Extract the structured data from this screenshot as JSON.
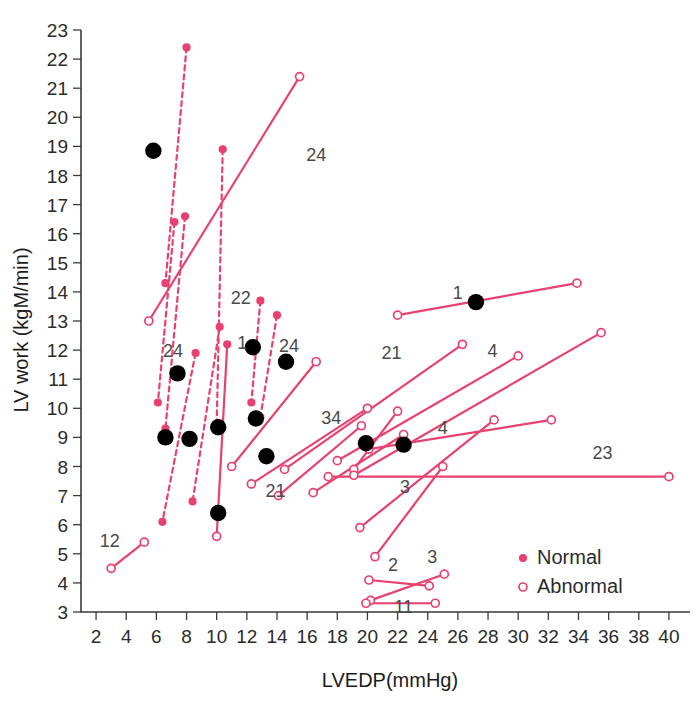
{
  "chart_data": {
    "type": "scatter",
    "title": "",
    "xlabel": "LVEDP(mmHg)",
    "ylabel": "LV work (kgM/min)",
    "xlim": [
      1.0,
      41.0
    ],
    "ylim": [
      2.5,
      23.5
    ],
    "xticks": [
      2,
      4,
      6,
      8,
      10,
      12,
      14,
      16,
      18,
      20,
      22,
      24,
      26,
      28,
      30,
      32,
      34,
      36,
      38,
      40
    ],
    "yticks": [
      3,
      4,
      5,
      6,
      7,
      8,
      9,
      10,
      11,
      12,
      13,
      14,
      15,
      16,
      17,
      18,
      19,
      20,
      21,
      22,
      23
    ],
    "grid": false,
    "legend": {
      "position": "bottom-right",
      "entries": [
        {
          "label": "Normal",
          "marker": "filled-circle",
          "color": "#e8416f"
        },
        {
          "label": "Abnormal",
          "marker": "open-circle",
          "color": "#e8416f"
        }
      ]
    },
    "colors": {
      "line": "#e8416f",
      "normal_marker": "#e8416f",
      "abnormal_marker_edge": "#e8416f",
      "solid_black_point": "#000000",
      "axis": "#3a3a3a",
      "annotation": "#4a4a4a"
    },
    "series": [
      {
        "name": "paired-segments",
        "description": "Each segment connects a paired pre/post measurement; dashed segments are one group, solid segments the other. Endpoint markers: 'normal' = filled pink dot, 'abnormal' = open pink circle.",
        "segments": [
          {
            "id": "s1",
            "style": "dashed",
            "label": "",
            "p1": {
              "x": 8.0,
              "y": 22.4,
              "marker": "normal"
            },
            "p2": {
              "x": 6.6,
              "y": 14.3,
              "marker": "normal"
            }
          },
          {
            "id": "s2",
            "style": "dashed",
            "label": "",
            "p1": {
              "x": 7.2,
              "y": 16.4,
              "marker": "normal"
            },
            "p2": {
              "x": 6.1,
              "y": 10.2,
              "marker": "normal"
            }
          },
          {
            "id": "s3",
            "style": "dashed",
            "label": "",
            "p1": {
              "x": 7.9,
              "y": 16.6,
              "marker": "normal"
            },
            "p2": {
              "x": 6.6,
              "y": 9.3,
              "marker": "normal"
            }
          },
          {
            "id": "s4",
            "style": "dashed",
            "label": "22",
            "p1": {
              "x": 10.4,
              "y": 18.9,
              "marker": "normal"
            },
            "p2": {
              "x": 10.0,
              "y": 9.4,
              "marker": "normal"
            }
          },
          {
            "id": "s5",
            "style": "solid",
            "label": "24",
            "p1": {
              "x": 15.5,
              "y": 21.4,
              "marker": "abnormal"
            },
            "p2": {
              "x": 5.5,
              "y": 13.0,
              "marker": "abnormal"
            }
          },
          {
            "id": "s6",
            "style": "dashed",
            "label": "24",
            "p1": {
              "x": 8.6,
              "y": 11.9,
              "marker": "normal"
            },
            "p2": {
              "x": 6.4,
              "y": 6.1,
              "marker": "normal"
            }
          },
          {
            "id": "s7",
            "style": "dashed",
            "label": "",
            "p1": {
              "x": 10.2,
              "y": 12.8,
              "marker": "normal"
            },
            "p2": {
              "x": 8.4,
              "y": 6.8,
              "marker": "normal"
            }
          },
          {
            "id": "s8",
            "style": "dashed",
            "label": "1",
            "p1": {
              "x": 12.9,
              "y": 13.7,
              "marker": "normal"
            },
            "p2": {
              "x": 12.3,
              "y": 10.2,
              "marker": "normal"
            }
          },
          {
            "id": "s9",
            "style": "dashed",
            "label": "24",
            "p1": {
              "x": 14.0,
              "y": 13.2,
              "marker": "normal"
            },
            "p2": {
              "x": 12.9,
              "y": 9.7,
              "marker": "normal"
            }
          },
          {
            "id": "s10",
            "style": "solid",
            "label": "",
            "p1": {
              "x": 10.0,
              "y": 5.6,
              "marker": "abnormal"
            },
            "p2": {
              "x": 10.7,
              "y": 12.2,
              "marker": "normal"
            }
          },
          {
            "id": "s11",
            "style": "solid",
            "label": "12",
            "p1": {
              "x": 3.0,
              "y": 4.5,
              "marker": "abnormal"
            },
            "p2": {
              "x": 5.2,
              "y": 5.4,
              "marker": "abnormal"
            }
          },
          {
            "id": "s12",
            "style": "solid",
            "label": "",
            "p1": {
              "x": 11.0,
              "y": 8.0,
              "marker": "abnormal"
            },
            "p2": {
              "x": 16.6,
              "y": 11.6,
              "marker": "abnormal"
            }
          },
          {
            "id": "s13",
            "style": "solid",
            "label": "21",
            "p1": {
              "x": 12.3,
              "y": 7.4,
              "marker": "abnormal"
            },
            "p2": {
              "x": 20.0,
              "y": 10.0,
              "marker": "abnormal"
            }
          },
          {
            "id": "s14",
            "style": "solid",
            "label": "",
            "p1": {
              "x": 14.1,
              "y": 7.0,
              "marker": "abnormal"
            },
            "p2": {
              "x": 19.6,
              "y": 9.4,
              "marker": "abnormal"
            }
          },
          {
            "id": "s15",
            "style": "solid",
            "label": "",
            "p1": {
              "x": 16.4,
              "y": 7.1,
              "marker": "abnormal"
            },
            "p2": {
              "x": 22.4,
              "y": 9.1,
              "marker": "abnormal"
            }
          },
          {
            "id": "s16",
            "style": "solid",
            "label": "34",
            "p1": {
              "x": 19.1,
              "y": 7.9,
              "marker": "abnormal"
            },
            "p2": {
              "x": 22.0,
              "y": 9.9,
              "marker": "abnormal"
            }
          },
          {
            "id": "s17",
            "style": "solid",
            "label": "3",
            "p1": {
              "x": 19.5,
              "y": 5.9,
              "marker": "abnormal"
            },
            "p2": {
              "x": 28.4,
              "y": 9.6,
              "marker": "abnormal"
            }
          },
          {
            "id": "s18",
            "style": "solid",
            "label": "1",
            "p1": {
              "x": 22.0,
              "y": 13.2,
              "marker": "abnormal"
            },
            "p2": {
              "x": 33.9,
              "y": 14.3,
              "marker": "abnormal"
            }
          },
          {
            "id": "s19",
            "style": "solid",
            "label": "21",
            "p1": {
              "x": 14.5,
              "y": 7.9,
              "marker": "abnormal"
            },
            "p2": {
              "x": 26.3,
              "y": 12.2,
              "marker": "abnormal"
            }
          },
          {
            "id": "s20",
            "style": "solid",
            "label": "4",
            "p1": {
              "x": 18.0,
              "y": 8.2,
              "marker": "abnormal"
            },
            "p2": {
              "x": 30.0,
              "y": 11.8,
              "marker": "abnormal"
            }
          },
          {
            "id": "s21",
            "style": "solid",
            "label": "4",
            "p1": {
              "x": 20.1,
              "y": 8.6,
              "marker": "abnormal"
            },
            "p2": {
              "x": 32.2,
              "y": 9.6,
              "marker": "abnormal"
            }
          },
          {
            "id": "s22",
            "style": "solid",
            "label": "",
            "p1": {
              "x": 19.1,
              "y": 7.7,
              "marker": "abnormal"
            },
            "p2": {
              "x": 35.5,
              "y": 12.6,
              "marker": "abnormal"
            }
          },
          {
            "id": "s23",
            "style": "solid",
            "label": "23",
            "p1": {
              "x": 17.4,
              "y": 7.65,
              "marker": "abnormal"
            },
            "p2": {
              "x": 40.0,
              "y": 7.65,
              "marker": "abnormal"
            }
          },
          {
            "id": "s24",
            "style": "solid",
            "label": "",
            "p1": {
              "x": 20.5,
              "y": 4.9,
              "marker": "abnormal"
            },
            "p2": {
              "x": 25.0,
              "y": 8.0,
              "marker": "abnormal"
            }
          },
          {
            "id": "s25",
            "style": "solid",
            "label": "2",
            "p1": {
              "x": 20.1,
              "y": 4.1,
              "marker": "abnormal"
            },
            "p2": {
              "x": 24.1,
              "y": 3.9,
              "marker": "abnormal"
            }
          },
          {
            "id": "s26",
            "style": "solid",
            "label": "3",
            "p1": {
              "x": 20.2,
              "y": 3.4,
              "marker": "abnormal"
            },
            "p2": {
              "x": 25.1,
              "y": 4.3,
              "marker": "abnormal"
            }
          },
          {
            "id": "s27",
            "style": "solid",
            "label": "11",
            "p1": {
              "x": 19.9,
              "y": 3.3,
              "marker": "abnormal"
            },
            "p2": {
              "x": 24.5,
              "y": 3.3,
              "marker": "abnormal"
            }
          }
        ]
      },
      {
        "name": "black-points",
        "description": "Isolated large solid black markers",
        "marker": "black-filled-circle",
        "points": [
          {
            "x": 5.8,
            "y": 18.85
          },
          {
            "x": 7.4,
            "y": 11.2
          },
          {
            "x": 12.4,
            "y": 12.1
          },
          {
            "x": 14.6,
            "y": 11.6
          },
          {
            "x": 6.6,
            "y": 9.0
          },
          {
            "x": 8.2,
            "y": 8.95
          },
          {
            "x": 10.1,
            "y": 9.35
          },
          {
            "x": 12.6,
            "y": 9.65
          },
          {
            "x": 13.3,
            "y": 8.35
          },
          {
            "x": 10.1,
            "y": 6.4
          },
          {
            "x": 19.9,
            "y": 8.8
          },
          {
            "x": 22.4,
            "y": 8.75
          },
          {
            "x": 27.2,
            "y": 13.65
          }
        ]
      }
    ],
    "annotations": [
      {
        "text": "24",
        "x": 16.6,
        "y": 18.5
      },
      {
        "text": "22",
        "x": 11.6,
        "y": 13.6
      },
      {
        "text": "24",
        "x": 7.1,
        "y": 11.75
      },
      {
        "text": "1",
        "x": 11.7,
        "y": 12.05
      },
      {
        "text": "24",
        "x": 14.8,
        "y": 11.95
      },
      {
        "text": "34",
        "x": 17.6,
        "y": 9.45
      },
      {
        "text": "21",
        "x": 21.6,
        "y": 11.7
      },
      {
        "text": "4",
        "x": 28.3,
        "y": 11.75
      },
      {
        "text": "1",
        "x": 26.0,
        "y": 13.75
      },
      {
        "text": "4",
        "x": 25.0,
        "y": 9.1
      },
      {
        "text": "23",
        "x": 35.6,
        "y": 8.25
      },
      {
        "text": "3",
        "x": 22.5,
        "y": 7.1
      },
      {
        "text": "21",
        "x": 13.9,
        "y": 6.95
      },
      {
        "text": "12",
        "x": 2.9,
        "y": 5.25
      },
      {
        "text": "2",
        "x": 21.7,
        "y": 4.4
      },
      {
        "text": "3",
        "x": 24.3,
        "y": 4.7
      },
      {
        "text": "11",
        "x": 22.4,
        "y": 2.95
      }
    ]
  },
  "figure": {
    "caption": ""
  }
}
